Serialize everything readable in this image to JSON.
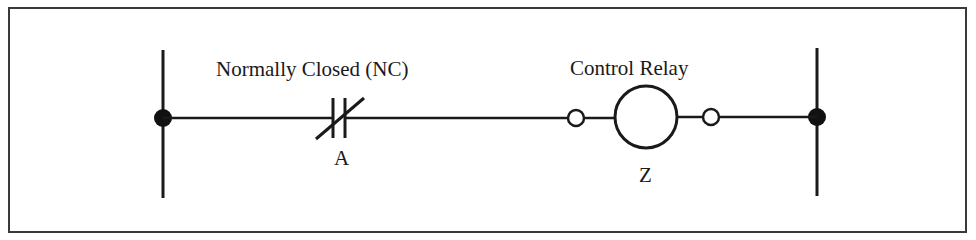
{
  "diagram": {
    "type": "ladder-logic-rung",
    "colors": {
      "stroke": "#1a1a1a",
      "frame": "#3a3a3a",
      "background": "#ffffff"
    },
    "rails": {
      "left": {
        "label": ""
      },
      "right": {
        "label": ""
      }
    },
    "contact": {
      "title": "Normally Closed (NC)",
      "tag": "A",
      "symbol": "normally-closed-contact"
    },
    "coil": {
      "title": "Control Relay",
      "tag": "Z",
      "symbol": "relay-coil"
    }
  }
}
